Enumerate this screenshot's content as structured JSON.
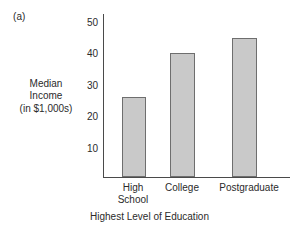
{
  "figure": {
    "panel_label": "(a)"
  },
  "chart_data": {
    "type": "bar",
    "title": "",
    "categories": [
      "High School",
      "College",
      "Postgraduate"
    ],
    "category_lines": [
      [
        "High",
        "School"
      ],
      [
        "College"
      ],
      [
        "Postgraduate"
      ]
    ],
    "values": [
      27,
      42,
      47
    ],
    "xlabel": "Highest Level of Education",
    "ylabel": "Median Income (in $1,000s)",
    "ylabel_lines": [
      "Median",
      "Income",
      "(in $1,000s)"
    ],
    "ylim": [
      0,
      55
    ],
    "yticks": [
      50,
      40,
      30,
      20,
      10
    ],
    "grid": false,
    "legend": false,
    "bar_fill": "#c9c9c9",
    "bar_edge": "#6e6e6e",
    "axis_color": "#4a4a4a"
  }
}
